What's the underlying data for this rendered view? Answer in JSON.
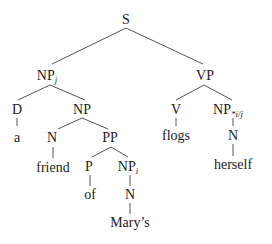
{
  "diagram": {
    "type": "syntax-tree",
    "colors": {
      "text": "#222222",
      "edge": "#555555",
      "background": "#ffffff"
    },
    "nodes": [
      {
        "id": "S",
        "label": "S",
        "sub": "",
        "x": 126,
        "y": 24
      },
      {
        "id": "NPj",
        "label": "NP",
        "sub": "j",
        "x": 47,
        "y": 80
      },
      {
        "id": "VP",
        "label": "VP",
        "sub": "",
        "x": 205,
        "y": 80
      },
      {
        "id": "D",
        "label": "D",
        "sub": "",
        "x": 17,
        "y": 114
      },
      {
        "id": "NP2",
        "label": "NP",
        "sub": "",
        "x": 82,
        "y": 114
      },
      {
        "id": "V",
        "label": "V",
        "sub": "",
        "x": 176,
        "y": 114
      },
      {
        "id": "NPij",
        "label": "NP",
        "sub": "*i/j",
        "x": 228,
        "y": 114
      },
      {
        "id": "a",
        "label": "a",
        "sub": "",
        "x": 17,
        "y": 142
      },
      {
        "id": "N1",
        "label": "N",
        "sub": "",
        "x": 52,
        "y": 142
      },
      {
        "id": "PP",
        "label": "PP",
        "sub": "",
        "x": 110,
        "y": 142
      },
      {
        "id": "flogs",
        "label": "flogs",
        "sub": "",
        "x": 176,
        "y": 140
      },
      {
        "id": "N3",
        "label": "N",
        "sub": "",
        "x": 233,
        "y": 140
      },
      {
        "id": "friend",
        "label": "friend",
        "sub": "",
        "x": 53,
        "y": 172
      },
      {
        "id": "P",
        "label": "P",
        "sub": "",
        "x": 89,
        "y": 171
      },
      {
        "id": "NPi",
        "label": "NP",
        "sub": "i",
        "x": 128,
        "y": 171
      },
      {
        "id": "herself",
        "label": "herself",
        "sub": "",
        "x": 233,
        "y": 169
      },
      {
        "id": "of",
        "label": "of",
        "sub": "",
        "x": 90,
        "y": 199
      },
      {
        "id": "N2",
        "label": "N",
        "sub": "",
        "x": 130,
        "y": 199
      },
      {
        "id": "marys",
        "label": "Mary’s",
        "sub": "",
        "x": 130,
        "y": 227
      }
    ],
    "edges": [
      {
        "x1": 126,
        "y1": 28,
        "x2": 52,
        "y2": 64
      },
      {
        "x1": 126,
        "y1": 28,
        "x2": 203,
        "y2": 64
      },
      {
        "x1": 50,
        "y1": 85,
        "x2": 18,
        "y2": 100
      },
      {
        "x1": 50,
        "y1": 85,
        "x2": 85,
        "y2": 100
      },
      {
        "x1": 204,
        "y1": 85,
        "x2": 176,
        "y2": 100
      },
      {
        "x1": 204,
        "y1": 85,
        "x2": 232,
        "y2": 100
      },
      {
        "x1": 17,
        "y1": 118,
        "x2": 17,
        "y2": 126
      },
      {
        "x1": 82,
        "y1": 118,
        "x2": 58,
        "y2": 129
      },
      {
        "x1": 82,
        "y1": 118,
        "x2": 108,
        "y2": 129
      },
      {
        "x1": 176,
        "y1": 118,
        "x2": 176,
        "y2": 126
      },
      {
        "x1": 233,
        "y1": 118,
        "x2": 233,
        "y2": 126
      },
      {
        "x1": 53,
        "y1": 147,
        "x2": 53,
        "y2": 158
      },
      {
        "x1": 111,
        "y1": 147,
        "x2": 92,
        "y2": 157
      },
      {
        "x1": 111,
        "y1": 147,
        "x2": 128,
        "y2": 157
      },
      {
        "x1": 233,
        "y1": 144,
        "x2": 233,
        "y2": 156
      },
      {
        "x1": 90,
        "y1": 175,
        "x2": 90,
        "y2": 186
      },
      {
        "x1": 130,
        "y1": 175,
        "x2": 130,
        "y2": 186
      },
      {
        "x1": 130,
        "y1": 203,
        "x2": 130,
        "y2": 214
      }
    ]
  }
}
